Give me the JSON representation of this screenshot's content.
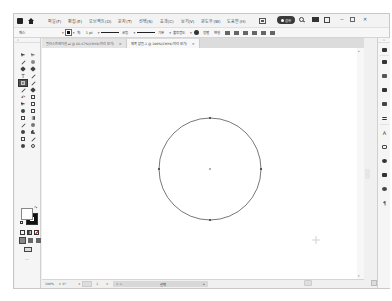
{
  "menubar": {
    "items": [
      "파일(F)",
      "편집(E)",
      "오브젝트(O)",
      "문자(T)",
      "선택(S)",
      "효과(C)",
      "보기(V)",
      "윈도우(W)",
      "도움말(H)"
    ],
    "share_label": "공유",
    "window_controls": {
      "minimize": "─",
      "maximize": "□",
      "close": "✕"
    }
  },
  "controlbar": {
    "selection_label": "패스",
    "stroke_label": "획:",
    "stroke_weight": "1 pt",
    "stroke_style": "균등",
    "brush_label": "기본",
    "opacity_label": "불투명도",
    "style_label": "스타일:",
    "align_label": "정렬",
    "transform_label": "변형",
    "dropdown": "▾"
  },
  "tabs": [
    {
      "label": "일러스트레이션.ai @ 66.67%(CMYK/미리 보기)",
      "close": "×",
      "active": false
    },
    {
      "label": "제목 없음-1 @ 100%(CMYK/미리 보기)",
      "close": "×",
      "active": true
    }
  ],
  "toolbox": {
    "collapse": "«",
    "tools": [
      "selection-tool",
      "direct-selection-tool",
      "magic-wand-tool",
      "lasso-tool",
      "pen-tool",
      "curvature-tool",
      "type-tool",
      "line-segment-tool",
      "ellipse-tool",
      "paintbrush-tool",
      "pencil-tool",
      "shaper-tool",
      "rotate-tool",
      "scale-tool",
      "width-tool",
      "free-transform-tool",
      "shape-builder-tool",
      "perspective-grid-tool",
      "mesh-tool",
      "gradient-tool",
      "eyedropper-tool",
      "blend-tool",
      "symbol-sprayer-tool",
      "column-graph-tool",
      "artboard-tool",
      "slice-tool",
      "hand-tool",
      "zoom-tool"
    ],
    "active_tool": "ellipse-tool",
    "fill_color": "#ffffff",
    "stroke_color": "#111111",
    "more": "···"
  },
  "canvas": {
    "shape": "circle",
    "circle": {
      "cx": 168,
      "cy": 121,
      "r": 51,
      "stroke": "#555555",
      "fill": "none"
    },
    "cursor": "crosshair"
  },
  "statusbar": {
    "zoom": "100%",
    "angle": "0°",
    "page": "1",
    "info_left": "< >",
    "info_mid": "선택",
    "play": "▸"
  },
  "right_dock": {
    "collapse": "»",
    "panels": [
      "properties",
      "layers",
      "libraries",
      "swatches",
      "brushes",
      "symbols",
      "stroke",
      "gradient",
      "transparency",
      "character",
      "artboards",
      "appearance",
      "graphic-styles",
      "align",
      "pathfinder",
      "paragraph"
    ]
  },
  "colors": {
    "window_bg": "#f0f0f0",
    "canvas": "#ffffff",
    "accent_dark": "#3a3a3a"
  }
}
